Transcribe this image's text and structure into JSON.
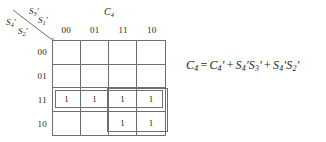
{
  "kmap": {
    "column_variable": {
      "name": "C",
      "subscript": "4"
    },
    "row_variables": [
      {
        "name": "S",
        "subscript": "4",
        "prime": true
      },
      {
        "name": "S",
        "subscript": "3",
        "prime": true
      },
      {
        "name": "S",
        "subscript": "2",
        "prime": true
      },
      {
        "name": "S",
        "subscript": "1",
        "prime": true
      }
    ],
    "column_headers": [
      "00",
      "01",
      "11",
      "10"
    ],
    "row_headers": [
      "00",
      "01",
      "11",
      "10"
    ],
    "cells": [
      [
        "",
        "",
        "",
        ""
      ],
      [
        "",
        "",
        "",
        ""
      ],
      [
        "1",
        "1",
        "1",
        "1"
      ],
      [
        "",
        "",
        "1",
        "1"
      ]
    ],
    "groups": [
      {
        "label": "group-row-11",
        "rows": [
          2
        ],
        "cols": [
          0,
          1,
          2,
          3
        ]
      },
      {
        "label": "group-quad-rows-11-10-cols-11-10",
        "rows": [
          2,
          3
        ],
        "cols": [
          2,
          3
        ]
      }
    ]
  },
  "equation": {
    "lhs": "C",
    "lhs_sub": "4",
    "eq": "=",
    "terms": [
      {
        "text": "C",
        "sub": "4",
        "prime": true
      },
      {
        "text": "S",
        "sub": "4",
        "prime": true,
        "text2": "S",
        "sub2": "3",
        "prime2": true
      },
      {
        "text": "S",
        "sub": "4",
        "prime": true,
        "text2": "S",
        "sub2": "2",
        "prime2": true
      }
    ],
    "plus": "+",
    "full_text": "C4 = C4' + S4'S3' + S4'S2'"
  },
  "colors": {
    "ink": "#231f20",
    "rule": "#6e6e70",
    "background": "#ffffff"
  }
}
